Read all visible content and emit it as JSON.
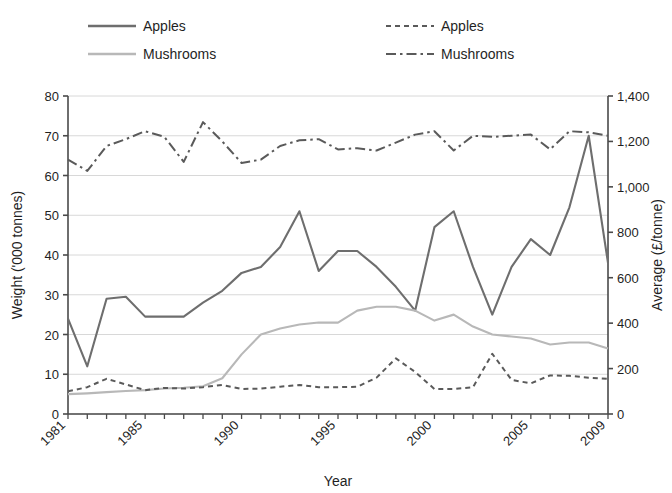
{
  "chart_data": {
    "type": "line",
    "title": "",
    "xlabel": "Year",
    "ylabel": "Weight ('000 tonnes)",
    "y2label": "Average (£/tonne)",
    "xlim": [
      1981,
      2009
    ],
    "ylim": [
      0,
      80
    ],
    "y2lim": [
      0,
      1400
    ],
    "ytick_step": 10,
    "y2tick_step": 200,
    "grid": true,
    "legend_position": "top",
    "x": [
      1981,
      1982,
      1983,
      1984,
      1985,
      1986,
      1987,
      1988,
      1989,
      1990,
      1991,
      1992,
      1993,
      1994,
      1995,
      1996,
      1997,
      1998,
      1999,
      2000,
      2001,
      2002,
      2003,
      2004,
      2005,
      2006,
      2007,
      2008,
      2009
    ],
    "xtick_labels": [
      "1981",
      "1985",
      "1990",
      "1995",
      "2000",
      "2005",
      "2009"
    ],
    "xtick_label_years": [
      1981,
      1985,
      1990,
      1995,
      2000,
      2005,
      2009
    ],
    "ytick_labels": [
      "0",
      "10",
      "20",
      "30",
      "40",
      "50",
      "60",
      "70",
      "80"
    ],
    "y2tick_labels": [
      "0",
      "200",
      "400",
      "600",
      "800",
      "1,000",
      "1,200",
      "1,400"
    ],
    "series": [
      {
        "name": "Apples",
        "axis": "left",
        "style": "solid",
        "color": "#6e6e6e",
        "units": "'000 tonnes",
        "values": [
          24,
          12,
          29,
          29.5,
          24.5,
          24.5,
          24.5,
          28,
          31,
          35.5,
          37,
          42,
          51,
          36,
          41,
          41,
          37,
          32,
          26,
          47,
          51,
          37,
          25,
          37,
          44,
          40,
          52,
          70,
          38
        ]
      },
      {
        "name": "Mushrooms",
        "axis": "left",
        "style": "solid",
        "color": "#b8b8b8",
        "units": "'000 tonnes",
        "values": [
          5,
          5.2,
          5.5,
          5.8,
          6,
          6.4,
          6.6,
          7,
          9,
          15,
          20,
          21.5,
          22.5,
          23,
          23,
          26,
          27,
          27,
          26,
          23.5,
          25,
          22,
          20,
          19.5,
          19,
          17.5,
          18,
          18,
          16.5
        ]
      },
      {
        "name": "Apples",
        "axis": "right",
        "style": "dotted",
        "color": "#5a5a5a",
        "units": "£/tonne",
        "values": [
          100,
          118,
          155,
          130,
          105,
          115,
          112,
          118,
          128,
          110,
          112,
          120,
          128,
          118,
          118,
          120,
          160,
          245,
          185,
          110,
          110,
          118,
          265,
          150,
          135,
          170,
          168,
          160,
          155
        ]
      },
      {
        "name": "Mushrooms",
        "axis": "right",
        "style": "dashdot",
        "color": "#5a5a5a",
        "units": "£/tonne",
        "values": [
          1120,
          1070,
          1180,
          1210,
          1245,
          1220,
          1110,
          1285,
          1200,
          1105,
          1120,
          1180,
          1205,
          1210,
          1165,
          1170,
          1160,
          1195,
          1230,
          1245,
          1160,
          1225,
          1220,
          1225,
          1230,
          1165,
          1245,
          1240,
          1225
        ]
      }
    ]
  },
  "legend": {
    "entries": [
      {
        "label": "Apples",
        "style": "solid",
        "color": "#6e6e6e"
      },
      {
        "label": "Mushrooms",
        "style": "solid",
        "color": "#b8b8b8"
      },
      {
        "label": "Apples",
        "style": "dotted",
        "color": "#5a5a5a"
      },
      {
        "label": "Mushrooms",
        "style": "dashdot",
        "color": "#5a5a5a"
      }
    ]
  },
  "colors": {
    "apples_weight": "#6e6e6e",
    "mushrooms_weight": "#b8b8b8",
    "price_lines": "#5a5a5a",
    "grid": "#d8d8d8",
    "axis": "#4a4a4a",
    "background": "#ffffff"
  }
}
